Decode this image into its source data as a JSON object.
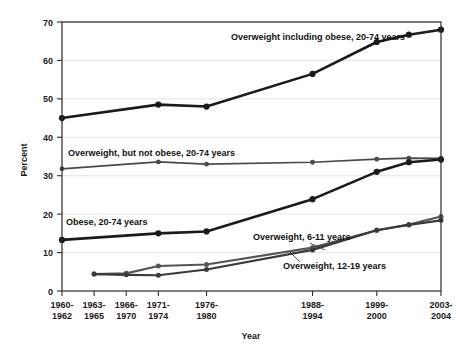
{
  "chart_data": {
    "type": "line",
    "title": "",
    "xlabel": "Year",
    "ylabel": "Percent",
    "ylim": [
      0,
      70
    ],
    "yticks": [
      0,
      10,
      20,
      30,
      40,
      50,
      60,
      70
    ],
    "grid": true,
    "legend_position": "inline-annotations",
    "categories": [
      "1960-1962",
      "1963-1965",
      "1966-1970",
      "1971-1974",
      "1976-1980",
      "1988-1994",
      "1999-2000",
      "2001-2002",
      "2003-2004"
    ],
    "category_lines": [
      [
        "1960-",
        "1962"
      ],
      [
        "1963-",
        "1965"
      ],
      [
        "1966-",
        "1970"
      ],
      [
        "1971-",
        "1974"
      ],
      [
        "1976-",
        "1980"
      ],
      [
        "1988-",
        "1994"
      ],
      [
        "1999-",
        "2000"
      ],
      [
        "",
        ""
      ],
      [
        "2003-",
        "2004"
      ]
    ],
    "tick_visible": [
      true,
      true,
      true,
      true,
      true,
      true,
      true,
      false,
      true
    ],
    "x_positions": [
      0,
      1,
      2,
      3,
      4.5,
      7.8,
      9.8,
      10.8,
      11.8
    ],
    "x_axis_span": [
      0,
      11.8
    ],
    "series": [
      {
        "name": "Overweight including obese, 20-74 years",
        "color": "#1a1a1a",
        "width": 2.6,
        "marker_radius": 3.1,
        "values": [
          45.0,
          null,
          null,
          48.5,
          48.0,
          56.5,
          64.8,
          66.7,
          68.0
        ]
      },
      {
        "name": "Overweight, but not obese, 20-74 years",
        "color": "#4a4a4a",
        "width": 1.7,
        "marker_radius": 2.4,
        "values": [
          31.8,
          null,
          null,
          33.6,
          33.0,
          33.5,
          34.3,
          34.6,
          34.5
        ]
      },
      {
        "name": "Obese, 20-74 years",
        "color": "#1a1a1a",
        "width": 2.6,
        "marker_radius": 3.1,
        "values": [
          13.3,
          null,
          null,
          15.0,
          15.5,
          23.9,
          31.0,
          33.5,
          34.2
        ]
      },
      {
        "name": "Overweight, 6-11 years",
        "color": "#555555",
        "width": 2.2,
        "marker_radius": 2.5,
        "values": [
          null,
          4.4,
          4.6,
          6.5,
          6.9,
          11.3,
          15.8,
          17.3,
          19.4
        ]
      },
      {
        "name": "Overweight, 12-19 years",
        "color": "#3a3a3a",
        "width": 2.2,
        "marker_radius": 2.5,
        "values": [
          null,
          4.4,
          4.2,
          4.1,
          5.6,
          10.7,
          15.8,
          17.2,
          18.4
        ]
      }
    ],
    "annotations": [
      {
        "id": "label-overweight-including-obese",
        "text": "Overweight including obese, 20-74 years",
        "x": 231,
        "y": 40,
        "anchor": "start",
        "leader": null
      },
      {
        "id": "label-overweight-not-obese",
        "text": "Overweight, but not obese, 20-74 years",
        "x": 68,
        "y": 156,
        "anchor": "start",
        "leader": null
      },
      {
        "id": "label-obese",
        "text": "Obese, 20-74 years",
        "x": 66,
        "y": 225,
        "anchor": "start",
        "leader": null
      },
      {
        "id": "label-overweight-6-11",
        "text": "Overweight, 6-11 years",
        "x": 253,
        "y": 240,
        "anchor": "start",
        "leader": [
          310,
          243,
          325,
          250
        ]
      },
      {
        "id": "label-overweight-12-19",
        "text": "Overweight, 12-19 years",
        "x": 283,
        "y": 269,
        "anchor": "start",
        "leader": [
          300,
          262,
          290,
          252
        ]
      }
    ]
  }
}
